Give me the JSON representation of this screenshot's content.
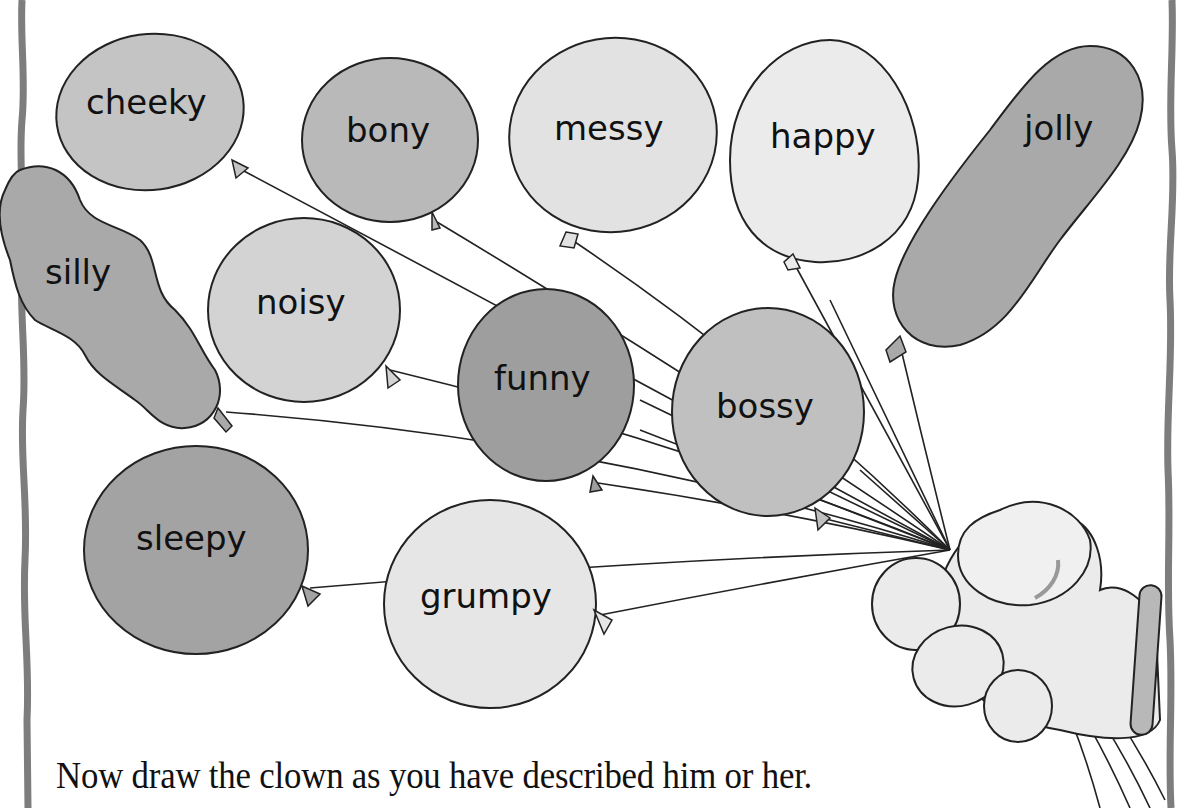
{
  "worksheet": {
    "instruction": "Now draw the clown as you have described him or her.",
    "colors": {
      "border": "#7d7d7d",
      "outline": "#222222",
      "dark_fill": "#a9a9a9",
      "mid_fill": "#c4c4c4",
      "light_fill": "#e6e6e6",
      "glove_fill": "#ebebeb",
      "cuff_fill": "#b8b8b8"
    },
    "balloons": [
      {
        "id": "cheeky",
        "label": "cheeky"
      },
      {
        "id": "bony",
        "label": "bony"
      },
      {
        "id": "messy",
        "label": "messy"
      },
      {
        "id": "happy",
        "label": "happy"
      },
      {
        "id": "jolly",
        "label": "jolly"
      },
      {
        "id": "silly",
        "label": "silly"
      },
      {
        "id": "noisy",
        "label": "noisy"
      },
      {
        "id": "funny",
        "label": "funny"
      },
      {
        "id": "bossy",
        "label": "bossy"
      },
      {
        "id": "sleepy",
        "label": "sleepy"
      },
      {
        "id": "grumpy",
        "label": "grumpy"
      }
    ]
  }
}
